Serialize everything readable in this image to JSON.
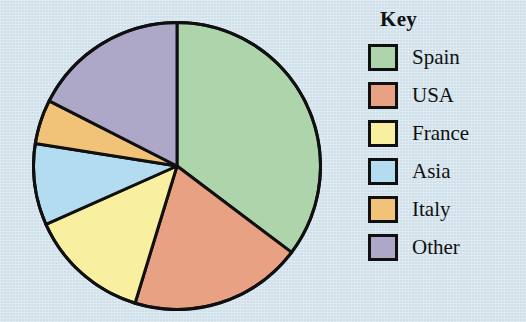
{
  "legend": {
    "title": "Key",
    "items": [
      {
        "label": "Spain",
        "color": "#aed4ac"
      },
      {
        "label": "USA",
        "color": "#e8a183"
      },
      {
        "label": "France",
        "color": "#f8f0a0"
      },
      {
        "label": "Asia",
        "color": "#b4dcf0"
      },
      {
        "label": "Italy",
        "color": "#f0c378"
      },
      {
        "label": "Other",
        "color": "#ada8c8"
      }
    ]
  },
  "chart_data": {
    "type": "pie",
    "title": "",
    "legend_title": "Key",
    "legend_position": "right",
    "grid": false,
    "start_angle_deg": 0,
    "direction": "clockwise",
    "categories": [
      "Spain",
      "USA",
      "France",
      "Asia",
      "Italy",
      "Other"
    ],
    "values": [
      35.3,
      19.4,
      13.6,
      9.2,
      5.0,
      17.5
    ],
    "colors": [
      "#aed4ac",
      "#e8a183",
      "#f8f0a0",
      "#b4dcf0",
      "#f0c378",
      "#ada8c8"
    ],
    "slice_angles_deg": [
      127,
      70,
      49,
      33,
      18,
      63
    ],
    "boundary_angles_deg": [
      0,
      127,
      197,
      246,
      279,
      297,
      360
    ],
    "stroke": "#101010",
    "stroke_width": 3,
    "background": "#cfe0ea"
  }
}
